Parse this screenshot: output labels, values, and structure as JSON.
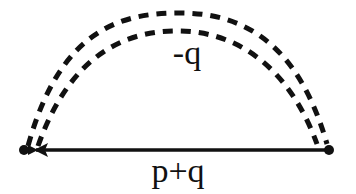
{
  "diagram": {
    "type": "feynman-diagram",
    "labels": {
      "boson_line": "-q",
      "fermion_line": "p+q"
    },
    "colors": {
      "line": "#111111",
      "background": "#ffffff"
    },
    "vertices": [
      {
        "name": "left-vertex",
        "x": 24,
        "y": 150
      },
      {
        "name": "right-vertex",
        "x": 329,
        "y": 150
      }
    ]
  }
}
